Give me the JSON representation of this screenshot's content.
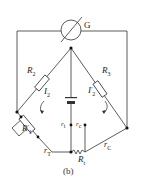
{
  "diagram": {
    "caption": "(b)",
    "galvanometer": {
      "label": "G"
    },
    "components": {
      "R2": {
        "main": "R",
        "sub": "2"
      },
      "R3": {
        "main": "R",
        "sub": "3"
      },
      "R1": {
        "main": "R",
        "sub": "1",
        "prime": "′"
      },
      "Rt": {
        "main": "R",
        "sub": "t"
      },
      "I2": {
        "main": "I",
        "sub": "2"
      },
      "I2p": {
        "main": "I",
        "sub": "2",
        "prime": "′"
      },
      "rT": {
        "main": "r",
        "sub": "T"
      },
      "rC": {
        "main": "r",
        "sub": "C"
      },
      "rt": {
        "main": "r",
        "sub": "t"
      },
      "rc": {
        "main": "r",
        "sub": "c"
      }
    },
    "stroke_color": "#333333"
  }
}
